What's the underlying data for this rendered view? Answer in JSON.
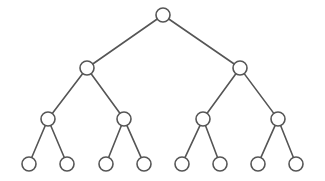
{
  "figure": {
    "kind": "binary-tree-diagram",
    "width": 325,
    "height": 181,
    "background_color": "#ffffff",
    "stroke_color": "#555555",
    "node_fill_color": "#ffffff",
    "stroke_width": 1.6,
    "depth": 4,
    "node_count": 15,
    "leaf_count": 8
  },
  "nodes": [
    {
      "id": "n0",
      "label": "",
      "level": 0,
      "cx": 163,
      "cy": 15,
      "r": 7
    },
    {
      "id": "n1",
      "label": "",
      "level": 1,
      "cx": 87,
      "cy": 68,
      "r": 7
    },
    {
      "id": "n2",
      "label": "",
      "level": 1,
      "cx": 240,
      "cy": 68,
      "r": 7
    },
    {
      "id": "n3",
      "label": "",
      "level": 2,
      "cx": 48,
      "cy": 119,
      "r": 7
    },
    {
      "id": "n4",
      "label": "",
      "level": 2,
      "cx": 124,
      "cy": 119,
      "r": 7
    },
    {
      "id": "n5",
      "label": "",
      "level": 2,
      "cx": 203,
      "cy": 119,
      "r": 7
    },
    {
      "id": "n6",
      "label": "",
      "level": 2,
      "cx": 278,
      "cy": 119,
      "r": 7
    },
    {
      "id": "n7",
      "label": "",
      "level": 3,
      "cx": 29,
      "cy": 164,
      "r": 7
    },
    {
      "id": "n8",
      "label": "",
      "level": 3,
      "cx": 67,
      "cy": 164,
      "r": 7
    },
    {
      "id": "n9",
      "label": "",
      "level": 3,
      "cx": 106,
      "cy": 164,
      "r": 7
    },
    {
      "id": "n10",
      "label": "",
      "level": 3,
      "cx": 144,
      "cy": 164,
      "r": 7
    },
    {
      "id": "n11",
      "label": "",
      "level": 3,
      "cx": 182,
      "cy": 164,
      "r": 7
    },
    {
      "id": "n12",
      "label": "",
      "level": 3,
      "cx": 220,
      "cy": 164,
      "r": 7
    },
    {
      "id": "n13",
      "label": "",
      "level": 3,
      "cx": 258,
      "cy": 164,
      "r": 7
    },
    {
      "id": "n14",
      "label": "",
      "level": 3,
      "cx": 296,
      "cy": 164,
      "r": 7
    }
  ],
  "edges": [
    {
      "from": "n0",
      "to": "n1"
    },
    {
      "from": "n0",
      "to": "n2"
    },
    {
      "from": "n1",
      "to": "n3"
    },
    {
      "from": "n1",
      "to": "n4"
    },
    {
      "from": "n2",
      "to": "n5"
    },
    {
      "from": "n2",
      "to": "n6"
    },
    {
      "from": "n3",
      "to": "n7"
    },
    {
      "from": "n3",
      "to": "n8"
    },
    {
      "from": "n4",
      "to": "n9"
    },
    {
      "from": "n4",
      "to": "n10"
    },
    {
      "from": "n5",
      "to": "n11"
    },
    {
      "from": "n5",
      "to": "n12"
    },
    {
      "from": "n6",
      "to": "n13"
    },
    {
      "from": "n6",
      "to": "n14"
    }
  ]
}
